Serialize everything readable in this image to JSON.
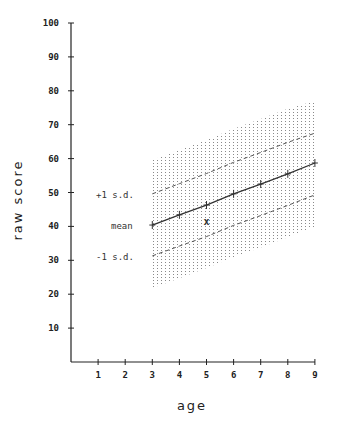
{
  "chart_data": {
    "type": "line",
    "title": "",
    "xlabel": "age",
    "ylabel": "raw score",
    "xlim": [
      0,
      9
    ],
    "ylim": [
      0,
      100
    ],
    "x_ticks": [
      1,
      2,
      3,
      4,
      5,
      6,
      7,
      8,
      9
    ],
    "y_ticks": [
      10,
      20,
      30,
      40,
      50,
      60,
      70,
      80,
      90,
      100
    ],
    "grid": false,
    "legend": null,
    "x": [
      3,
      4,
      5,
      6,
      7,
      8,
      9
    ],
    "series": [
      {
        "name": "mean",
        "style": "solid-with-plus-markers",
        "values": [
          40.4,
          43.4,
          46.3,
          49.6,
          52.5,
          55.5,
          58.7
        ]
      },
      {
        "name": "+1 s.d.",
        "style": "dashed",
        "values": [
          49.6,
          52.6,
          55.6,
          58.9,
          61.8,
          64.8,
          67.5
        ]
      },
      {
        "name": "-1 s.d.",
        "style": "dashed",
        "values": [
          31.3,
          34.2,
          37.0,
          40.3,
          43.2,
          46.2,
          49.3
        ]
      },
      {
        "name": "shaded band upper (+2 s.d.)",
        "style": "dotted-fill-boundary",
        "values": [
          59.6,
          62.6,
          65.5,
          68.8,
          71.7,
          74.7,
          77.0
        ]
      },
      {
        "name": "shaded band lower (-2 s.d.)",
        "style": "dotted-fill-boundary",
        "values": [
          21.8,
          24.7,
          27.7,
          30.9,
          33.8,
          36.8,
          40.0
        ]
      }
    ],
    "points": [
      {
        "label": "x",
        "x": 5,
        "y": 41.3
      }
    ],
    "annotations": [
      {
        "text": "+1 s.d.",
        "anchor_series": "+1 s.d.",
        "position": "left of age 3"
      },
      {
        "text": "mean",
        "anchor_series": "mean",
        "position": "left of age 3"
      },
      {
        "text": "-1 s.d.",
        "anchor_series": "-1 s.d.",
        "position": "left of age 3"
      }
    ]
  },
  "labels": {
    "xlabel": "age",
    "ylabel": "raw score",
    "plus_sd": "+1 s.d.",
    "mean": "mean",
    "minus_sd": "-1 s.d.",
    "marker": "x"
  },
  "colors": {
    "axis": "#222222",
    "line": "#333333",
    "dashed": "#555555",
    "dots": "#8a8a8a",
    "background": "#ffffff"
  }
}
